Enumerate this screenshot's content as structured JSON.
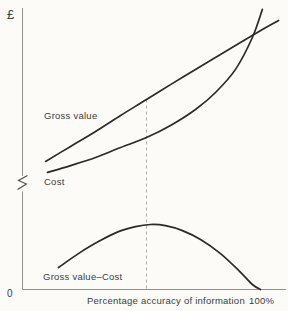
{
  "chart_data": {
    "type": "line",
    "title": "",
    "xlabel": "Percentage accuracy of information",
    "ylabel": "£",
    "origin_tick_label": "0",
    "x_end_tick_label": "100%",
    "x_range_pct": [
      0,
      100
    ],
    "y_axis_note": "arbitrary money units (qualitative scale, y-axis shown with a break)",
    "grid": false,
    "legend": "labels placed directly on curves",
    "series": [
      {
        "id": "gross_value",
        "name": "Gross value",
        "x_pct": [
          9.7,
          20.2,
          30.7,
          41.2,
          52.1,
          62.2,
          72.7,
          83.2,
          93.7,
          100.8,
          107.6
        ],
        "v": [
          48.9,
          54.6,
          60.3,
          66.4,
          72.5,
          78.2,
          84.0,
          89.7,
          95.4,
          99.2,
          102.7
        ]
      },
      {
        "id": "cost",
        "name": "Cost",
        "x_pct": [
          10.5,
          20.2,
          30.7,
          41.2,
          52.1,
          62.2,
          72.7,
          81.1,
          89.5,
          96.6,
          100.8
        ],
        "v": [
          44.7,
          47.3,
          50.4,
          54.2,
          58.0,
          62.6,
          68.7,
          75.2,
          84.0,
          96.2,
          106.9
        ]
      },
      {
        "id": "gross_minus_cost",
        "name": "Gross value–Cost",
        "x_pct": [
          15.1,
          23.5,
          31.9,
          40.3,
          47.5,
          53.8,
          60.1,
          67.2,
          74.8,
          83.2,
          90.8,
          96.6,
          100.0
        ],
        "v": [
          8.4,
          13.7,
          18.3,
          22.1,
          24.0,
          24.8,
          24.4,
          22.5,
          19.1,
          13.7,
          7.3,
          1.9,
          0.0
        ]
      }
    ],
    "annotations": {
      "dashed_vertical_line": {
        "x_pct": 52.1,
        "from_v": 0,
        "to_v": 72.5
      },
      "curves_cross_at_x_pct": 97,
      "y_axis_break": true
    },
    "colors": {
      "curve": "#2a2a2a",
      "axis": "#8f8f8f",
      "dashed": "#a0a0a0",
      "text": "#3b3b3b",
      "background": "#fcfbf8"
    }
  }
}
